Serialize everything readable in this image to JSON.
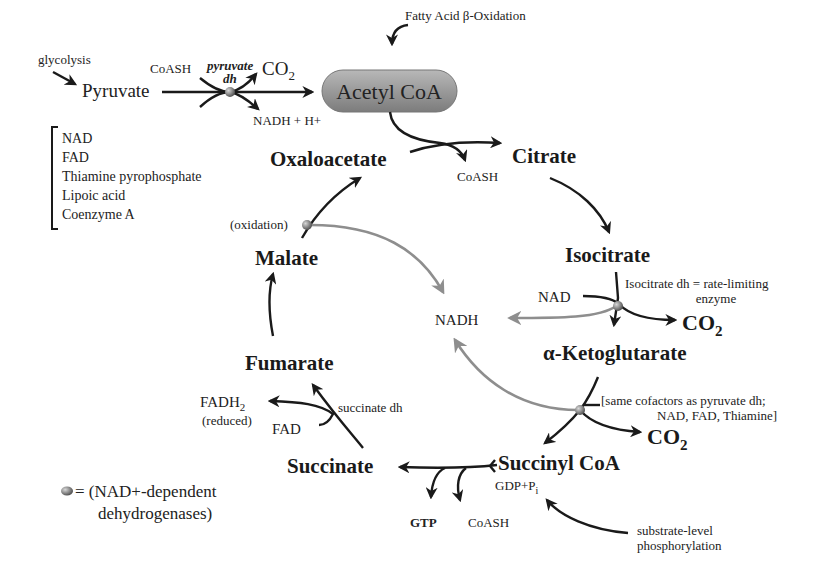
{
  "title_inputs": {
    "glycolysis": "glycolysis",
    "pyruvate": "Pyruvate",
    "coash_in": "CoASH",
    "pyruvate_dh_line1": "pyruvate",
    "pyruvate_dh_line2": "dh",
    "co2": "CO",
    "co2_sub": "2",
    "nadh_h": "NADH + H+",
    "fatty_acid": "Fatty Acid β-Oxidation",
    "acetyl_coa": "Acetyl CoA"
  },
  "cofactor_list": {
    "items": [
      "NAD",
      "FAD",
      "Thiamine pyrophosphate",
      "Lipoic acid",
      "Coenzyme A"
    ]
  },
  "cycle": {
    "oxaloacetate": "Oxaloacetate",
    "citrate": "Citrate",
    "coash_citrate": "CoASH",
    "isocitrate": "Isocitrate",
    "isocitrate_note_line1": "Isocitrate dh = rate-limiting",
    "isocitrate_note_line2": "enzyme",
    "nad": "NAD",
    "nadh_center": "NADH",
    "co2_1": "CO",
    "co2_1_sub": "2",
    "alpha_kg": "α-Ketoglutarate",
    "akg_note_line1": "[same cofactors as pyruvate dh;",
    "akg_note_line2": "NAD, FAD, Thiamine]",
    "co2_2": "CO",
    "co2_2_sub": "2",
    "succinyl_coa": "Succinyl CoA",
    "gdp_pi": "GDP+P",
    "gdp_pi_sub": "i",
    "gtp": "GTP",
    "coash_succ": "CoASH",
    "substrate_level_line1": "substrate-level",
    "substrate_level_line2": "phosphorylation",
    "succinate": "Succinate",
    "succinate_dh": "succinate dh",
    "fad": "FAD",
    "fadh2": "FADH",
    "fadh2_sub": "2",
    "reduced": "(reduced)",
    "fumarate": "Fumarate",
    "malate": "Malate",
    "oxidation": "(oxidation)"
  },
  "legend": {
    "line1": "= (NAD+-dependent",
    "line2": "dehydrogenases)"
  },
  "colors": {
    "ink": "#1a1a1a",
    "nadh_arrows": "#8e8e8e",
    "acetyl_fill": "#9a9a9a",
    "enzyme_dot": "#7a7a7a"
  }
}
